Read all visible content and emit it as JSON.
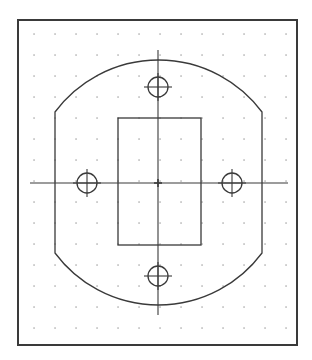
{
  "drawing": {
    "background": "#ffffff",
    "line_color": "#3a3a3a",
    "grid_color": "#9a9a9a",
    "frame": {
      "x": 18,
      "y": 20,
      "width": 279,
      "height": 325
    },
    "grid": {
      "x_start": 34,
      "y_start": 34,
      "spacing": 21,
      "cols": 13,
      "rows": 15
    },
    "center": {
      "x": 158,
      "y": 183
    },
    "outer_profile": {
      "left_x": 55,
      "right_x": 262,
      "top_y": 54,
      "bottom_y": 310,
      "arc_top_end_y": 112,
      "arc_bottom_start_y": 253,
      "radius": 129
    },
    "inner_rectangle": {
      "x": 118,
      "y": 118,
      "width": 83,
      "height": 127
    },
    "centerlines": {
      "horizontal": {
        "x1": 30,
        "x2": 288
      },
      "vertical": {
        "y1": 50,
        "y2": 315
      }
    },
    "holes": [
      {
        "name": "top",
        "cx": 158,
        "cy": 87,
        "r": 10
      },
      {
        "name": "bottom",
        "cx": 158,
        "cy": 276,
        "r": 10
      },
      {
        "name": "left",
        "cx": 87,
        "cy": 183,
        "r": 10
      },
      {
        "name": "right",
        "cx": 232,
        "cy": 183,
        "r": 10
      }
    ]
  }
}
